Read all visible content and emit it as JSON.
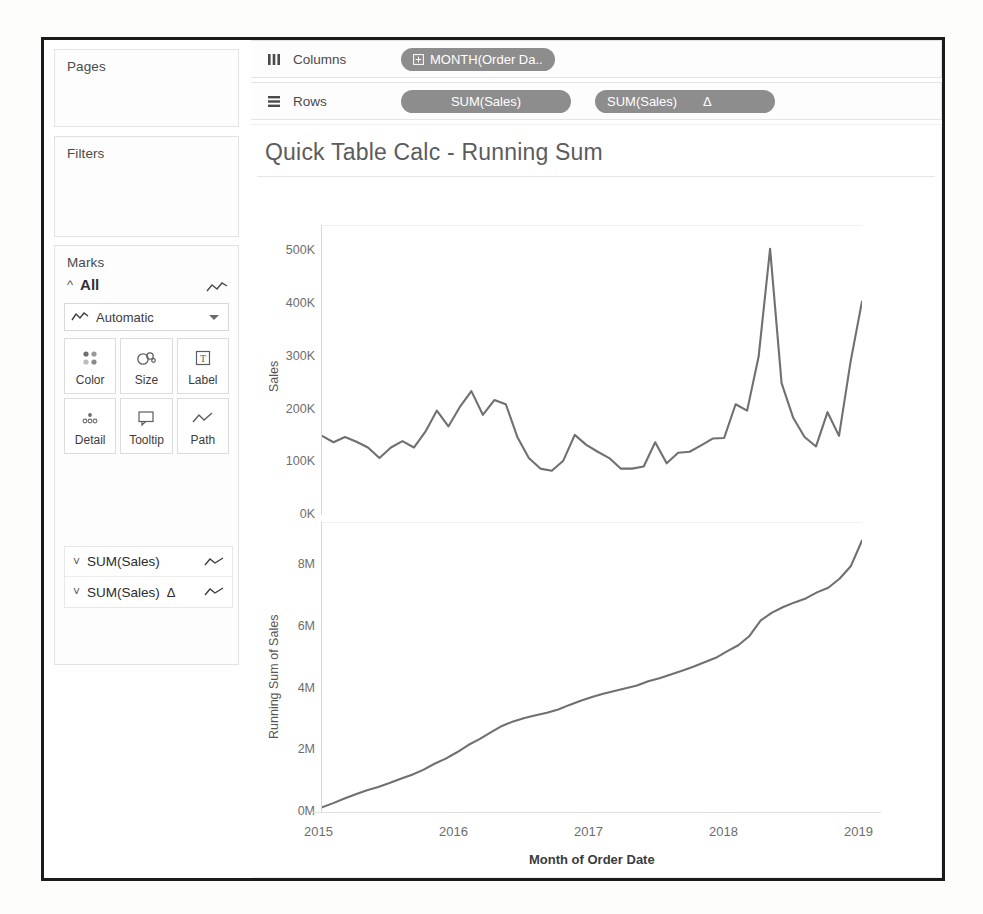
{
  "sidebar": {
    "pages": {
      "title": "Pages"
    },
    "filters": {
      "title": "Filters"
    },
    "marks": {
      "title": "Marks",
      "all_label": "All",
      "mark_type": "Automatic",
      "buttons": [
        {
          "label": "Color",
          "icon": "color-dots-icon"
        },
        {
          "label": "Size",
          "icon": "size-circles-icon"
        },
        {
          "label": "Label",
          "icon": "label-text-icon"
        },
        {
          "label": "Detail",
          "icon": "detail-dots-icon"
        },
        {
          "label": "Tooltip",
          "icon": "tooltip-bubble-icon"
        },
        {
          "label": "Path",
          "icon": "path-line-icon"
        }
      ],
      "measure_cards": [
        {
          "label": "SUM(Sales)",
          "delta": "",
          "mark_icon": "line-mark-icon"
        },
        {
          "label": "SUM(Sales)",
          "delta": "Δ",
          "mark_icon": "line-mark-icon"
        }
      ]
    }
  },
  "shelves": {
    "columns": {
      "label": "Columns",
      "icon": "columns-icon",
      "pills": [
        {
          "text": "MONTH(Order Da..",
          "icon": "plus-box-icon",
          "delta": ""
        }
      ]
    },
    "rows": {
      "label": "Rows",
      "icon": "rows-icon",
      "pills": [
        {
          "text": "SUM(Sales)",
          "icon": "",
          "delta": ""
        },
        {
          "text": "SUM(Sales)",
          "icon": "",
          "delta": "Δ"
        }
      ]
    }
  },
  "viz": {
    "title": "Quick Table Calc - Running Sum",
    "xtitle": "Month of Order Date",
    "xticks": [
      "2015",
      "2016",
      "2017",
      "2018",
      "2019"
    ]
  },
  "colors": {
    "line": "#707070",
    "pill": "#8d8d8d",
    "axis": "#d6d6d6",
    "text": "#4a4a4a",
    "frame": "#1b1b1b"
  },
  "chart_data": [
    {
      "type": "line",
      "title": "Sales by Month",
      "ylabel": "Sales",
      "xlabel": "Month of Order Date",
      "ylim": [
        0,
        550000
      ],
      "yticks": [
        0,
        100000,
        200000,
        300000,
        400000,
        500000
      ],
      "ytick_labels": [
        "0K",
        "100K",
        "200K",
        "300K",
        "400K",
        "500K"
      ],
      "xlim": [
        "2015-01",
        "2018-12"
      ],
      "grid": false,
      "x": [
        "2015-01",
        "2015-02",
        "2015-03",
        "2015-04",
        "2015-05",
        "2015-06",
        "2015-07",
        "2015-08",
        "2015-09",
        "2015-10",
        "2015-11",
        "2015-12",
        "2016-01",
        "2016-02",
        "2016-03",
        "2016-04",
        "2016-05",
        "2016-06",
        "2016-07",
        "2016-08",
        "2016-09",
        "2016-10",
        "2016-11",
        "2016-12",
        "2017-01",
        "2017-02",
        "2017-03",
        "2017-04",
        "2017-05",
        "2017-06",
        "2017-07",
        "2017-08",
        "2017-09",
        "2017-10",
        "2017-11",
        "2017-12",
        "2018-01",
        "2018-02",
        "2018-03",
        "2018-04",
        "2018-05",
        "2018-06",
        "2018-07",
        "2018-08",
        "2018-09",
        "2018-10",
        "2018-11",
        "2018-12"
      ],
      "values": [
        150000,
        138000,
        148000,
        139000,
        128000,
        108000,
        128000,
        140000,
        128000,
        158000,
        198000,
        168000,
        205000,
        235000,
        190000,
        218000,
        210000,
        148000,
        108000,
        88000,
        84000,
        103000,
        152000,
        133000,
        120000,
        108000,
        88000,
        88000,
        92000,
        138000,
        98000,
        118000,
        120000,
        132000,
        145000,
        146000,
        210000,
        198000,
        300000,
        505000,
        250000,
        185000,
        148000,
        130000,
        195000,
        150000,
        290000,
        405000
      ]
    },
    {
      "type": "line",
      "title": "Running Sum of Sales by Month",
      "ylabel": "Running Sum of Sales",
      "xlabel": "Month of Order Date",
      "ylim": [
        0,
        9400000
      ],
      "yticks": [
        0,
        2000000,
        4000000,
        6000000,
        8000000
      ],
      "ytick_labels": [
        "0M",
        "2M",
        "4M",
        "6M",
        "8M"
      ],
      "xlim": [
        "2015-01",
        "2018-12"
      ],
      "grid": false,
      "x": [
        "2015-01",
        "2015-02",
        "2015-03",
        "2015-04",
        "2015-05",
        "2015-06",
        "2015-07",
        "2015-08",
        "2015-09",
        "2015-10",
        "2015-11",
        "2015-12",
        "2016-01",
        "2016-02",
        "2016-03",
        "2016-04",
        "2016-05",
        "2016-06",
        "2016-07",
        "2016-08",
        "2016-09",
        "2016-10",
        "2016-11",
        "2016-12",
        "2017-01",
        "2017-02",
        "2017-03",
        "2017-04",
        "2017-05",
        "2017-06",
        "2017-07",
        "2017-08",
        "2017-09",
        "2017-10",
        "2017-11",
        "2017-12",
        "2018-01",
        "2018-02",
        "2018-03",
        "2018-04",
        "2018-05",
        "2018-06",
        "2018-07",
        "2018-08",
        "2018-09",
        "2018-10",
        "2018-11",
        "2018-12"
      ],
      "values": [
        150000,
        288000,
        436000,
        575000,
        703000,
        811000,
        939000,
        1079000,
        1207000,
        1365000,
        1563000,
        1731000,
        1936000,
        2171000,
        2361000,
        2579000,
        2789000,
        2937000,
        3045000,
        3133000,
        3217000,
        3320000,
        3472000,
        3605000,
        3725000,
        3833000,
        3921000,
        4009000,
        4101000,
        4239000,
        4337000,
        4455000,
        4575000,
        4707000,
        4852000,
        4998000,
        5208000,
        5406000,
        5706000,
        6211000,
        6461000,
        6646000,
        6794000,
        6924000,
        7119000,
        7269000,
        7559000,
        7964000,
        8800000
      ]
    }
  ]
}
